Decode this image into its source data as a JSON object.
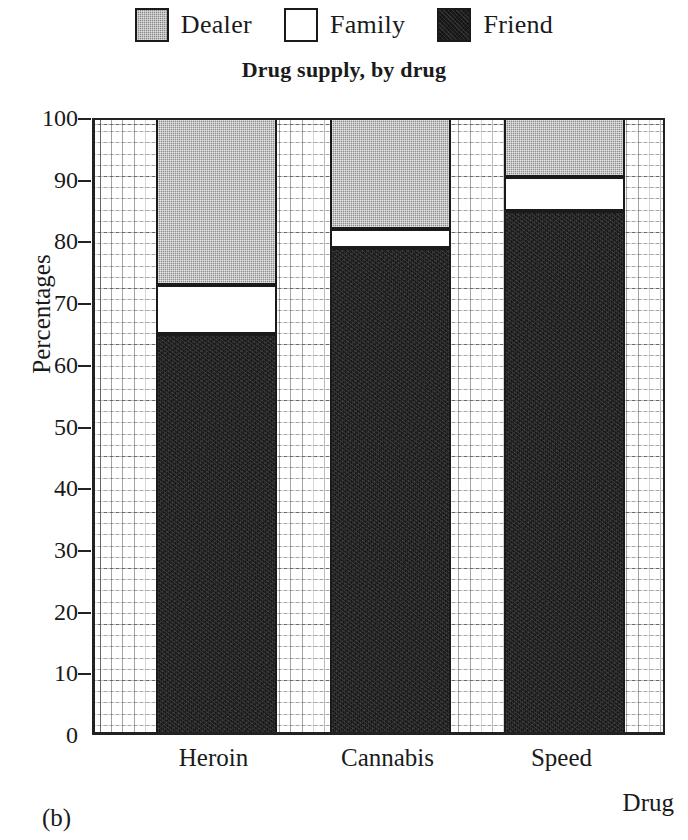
{
  "chart_data": {
    "type": "bar",
    "subtype": "stacked-bar-100",
    "title": "Drug supply, by drug",
    "xlabel": "Drug",
    "ylabel": "Percentages",
    "categories": [
      "Heroin",
      "Cannabis",
      "Speed"
    ],
    "series": [
      {
        "name": "Friend",
        "color": "#181818",
        "values": [
          64.5,
          78.5,
          84.5
        ]
      },
      {
        "name": "Family",
        "color": "#ffffff",
        "values": [
          8.0,
          3.0,
          5.5
        ]
      },
      {
        "name": "Dealer",
        "color": "#8c8c8c",
        "values": [
          27.5,
          18.5,
          10.0
        ]
      }
    ],
    "cumulative_tops": {
      "Heroin": {
        "friend": 64.5,
        "family": 72.5,
        "dealer": 100
      },
      "Cannabis": {
        "friend": 78.5,
        "family": 81.5,
        "dealer": 100
      },
      "Speed": {
        "friend": 84.5,
        "family": 90.0,
        "dealer": 100
      }
    },
    "ylim": [
      0,
      100
    ],
    "ytick_labels": [
      "100",
      "90",
      "80",
      "70",
      "60",
      "50",
      "40",
      "30",
      "20",
      "10",
      "0"
    ],
    "ytick_values": [
      100,
      90,
      80,
      70,
      60,
      50,
      40,
      30,
      20,
      10,
      0
    ],
    "grid": true,
    "grid_style": "fine dotted minor grid with solid major gridlines",
    "legend_position": "above-plot-centered"
  },
  "legend": {
    "entries": [
      {
        "label": "Dealer",
        "swatch": "dealer-swatch"
      },
      {
        "label": "Family",
        "swatch": "family-swatch"
      },
      {
        "label": "Friend",
        "swatch": "friend-swatch"
      }
    ]
  },
  "caption": {
    "panel": "(b)"
  }
}
